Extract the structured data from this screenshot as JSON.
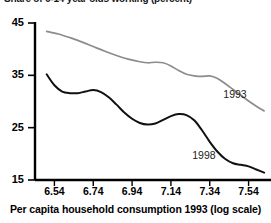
{
  "chart_data": {
    "type": "line",
    "title": "Share of 6-14 year olds working (percent)",
    "xlabel": "Per capita household consumption 1993 (log scale)",
    "ylabel": "",
    "xlim": [
      6.44,
      7.64
    ],
    "ylim": [
      15,
      45
    ],
    "grid": false,
    "legend_position": "inline-right",
    "xticks": [
      "6.54",
      "6.74",
      "6.94",
      "7.14",
      "7.34",
      "7.54"
    ],
    "yticks": [
      "45",
      "35",
      "25",
      "15"
    ],
    "series": [
      {
        "name": "1993",
        "color": "#8c8c8c",
        "label_x": 7.41,
        "label_y": 31.5,
        "x": [
          6.5,
          6.56,
          6.62,
          6.68,
          6.74,
          6.8,
          6.86,
          6.92,
          6.98,
          7.02,
          7.06,
          7.1,
          7.14,
          7.18,
          7.22,
          7.26,
          7.3,
          7.34,
          7.38,
          7.42,
          7.46,
          7.5,
          7.54,
          7.58,
          7.62
        ],
        "values": [
          43.4,
          42.9,
          42.2,
          41.4,
          40.5,
          39.6,
          38.8,
          38.1,
          37.6,
          37.4,
          37.5,
          37.4,
          36.8,
          35.9,
          35.2,
          34.9,
          34.8,
          34.9,
          34.4,
          33.4,
          32.3,
          31.2,
          30.1,
          29.1,
          28.2
        ]
      },
      {
        "name": "1998",
        "color": "#111111",
        "label_x": 7.25,
        "label_y": 19.8,
        "x": [
          6.5,
          6.54,
          6.58,
          6.62,
          6.66,
          6.7,
          6.74,
          6.78,
          6.82,
          6.86,
          6.9,
          6.94,
          6.98,
          7.02,
          7.06,
          7.1,
          7.14,
          7.18,
          7.22,
          7.26,
          7.3,
          7.34,
          7.38,
          7.42,
          7.46,
          7.5,
          7.54,
          7.58,
          7.62
        ],
        "values": [
          35.2,
          33.1,
          31.9,
          31.6,
          31.6,
          31.9,
          32.2,
          31.8,
          30.8,
          29.4,
          27.9,
          26.7,
          25.9,
          25.6,
          25.8,
          26.5,
          27.2,
          27.6,
          27.4,
          26.4,
          24.5,
          22.3,
          20.4,
          19.0,
          18.2,
          17.9,
          17.6,
          17.0,
          16.4
        ]
      }
    ]
  }
}
